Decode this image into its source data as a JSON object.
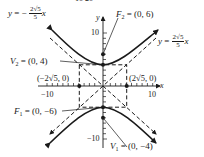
{
  "figure": {
    "title_fragment": "10  20",
    "axes": {
      "x_label": "x",
      "y_label": "y",
      "x_ticks": {
        "neg": "−10",
        "pos": "10"
      },
      "y_ticks": {
        "pos": "10",
        "neg": "−10"
      }
    },
    "labels": {
      "asymptote_neg": {
        "lhs": "y = −",
        "num": "2√5",
        "den": "5",
        "var": "x"
      },
      "asymptote_pos": {
        "lhs": "y = ",
        "num": "2√5",
        "den": "5",
        "var": "x"
      },
      "F2": {
        "name": "F",
        "sub": "2",
        "value": " = (0, 6)"
      },
      "V2": {
        "name": "V",
        "sub": "2",
        "value": " = (0, 4)"
      },
      "F1": {
        "name": "F",
        "sub": "1",
        "value": " = (0, −6)"
      },
      "V1": {
        "name": "V",
        "sub": "1",
        "value": " = (0, −4)"
      },
      "left_point": "(−2√5, 0)",
      "right_point": "(2√5, 0)"
    },
    "colors": {
      "ink": "#1a1a1a",
      "background": "#ffffff"
    },
    "hyperbola": {
      "equation": "y²/16 − x²/20 = 1",
      "a": 4,
      "b": "2√5",
      "c": 6
    }
  }
}
